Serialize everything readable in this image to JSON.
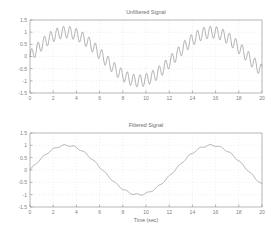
{
  "figure": {
    "background": "#ffffff",
    "line_color": "#8c8c8c",
    "axis_color": "#9a9a9a",
    "grid_color": "#dcdcdc",
    "text_color": "#6e6e6e"
  },
  "chart_data": [
    {
      "type": "line",
      "id": "unfiltered",
      "title": "Unfiltered Signal",
      "xlabel": "",
      "ylabel": "",
      "xlim": [
        0,
        20
      ],
      "ylim": [
        -1.5,
        1.5
      ],
      "xticks": [
        0,
        2,
        4,
        6,
        8,
        10,
        12,
        14,
        16,
        18,
        20
      ],
      "xticklabels": [
        "0",
        "2",
        "4",
        "6",
        "8",
        "10",
        "12",
        "14",
        "16",
        "18",
        "20"
      ],
      "yticks": [
        -1.5,
        -1,
        -0.5,
        0,
        0.5,
        1,
        1.5
      ],
      "yticklabels": [
        "-1.5",
        "-1",
        "-0.5",
        "0",
        "0.5",
        "1",
        "1.5"
      ],
      "grid": true,
      "legend": null,
      "series": [
        {
          "name": "unfiltered signal",
          "color": "#8c8c8c",
          "description": "Slow sinusoid of amplitude 1.0 and period 12.5 s, plus high-frequency ripple of amplitude 0.25 and period 0.55 s",
          "components": [
            {
              "kind": "sine",
              "amplitude": 1.0,
              "period": 12.5,
              "phase": 0.0,
              "offset": 0.0
            },
            {
              "kind": "sine",
              "amplitude": 0.25,
              "period": 0.55,
              "phase": 0.0,
              "offset": 0.0
            }
          ],
          "x_start": 0,
          "x_end": 20,
          "samples": 1400
        }
      ]
    },
    {
      "type": "line",
      "id": "filtered",
      "title": "Filtered Signal",
      "xlabel": "Time (sec)",
      "ylabel": "",
      "xlim": [
        0,
        20
      ],
      "ylim": [
        -1.5,
        1.5
      ],
      "xticks": [
        0,
        2,
        4,
        6,
        8,
        10,
        12,
        14,
        16,
        18,
        20
      ],
      "xticklabels": [
        "0",
        "2",
        "4",
        "6",
        "8",
        "10",
        "12",
        "14",
        "16",
        "18",
        "20"
      ],
      "yticks": [
        -1.5,
        -1,
        -0.5,
        0,
        0.5,
        1,
        1.5
      ],
      "yticklabels": [
        "-1.5",
        "-1",
        "-0.5",
        "0",
        "0.5",
        "1",
        "1.5"
      ],
      "grid": true,
      "legend": null,
      "series": [
        {
          "name": "filtered signal",
          "color": "#8c8c8c",
          "description": "Slow sinusoid of amplitude 1.0 and period 12.5 s with small residual ripple of amplitude 0.03",
          "components": [
            {
              "kind": "sine",
              "amplitude": 1.0,
              "period": 12.5,
              "phase": 0.0,
              "offset": 0.0
            },
            {
              "kind": "sine",
              "amplitude": 0.03,
              "period": 0.9,
              "phase": 0.0,
              "offset": 0.0
            }
          ],
          "x_start": 0,
          "x_end": 20,
          "samples": 700
        }
      ]
    }
  ]
}
